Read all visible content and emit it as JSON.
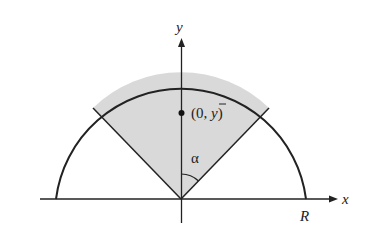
{
  "diagram": {
    "axes": {
      "x_label": "x",
      "y_label": "y"
    },
    "labels": {
      "radius": "R",
      "angle": "α",
      "centroid_open": "(0, ",
      "centroid_var": "y",
      "centroid_close": ")"
    },
    "colors": {
      "sector_fill": "#d9d9d9",
      "stroke": "#222222",
      "background": "#ffffff"
    }
  }
}
